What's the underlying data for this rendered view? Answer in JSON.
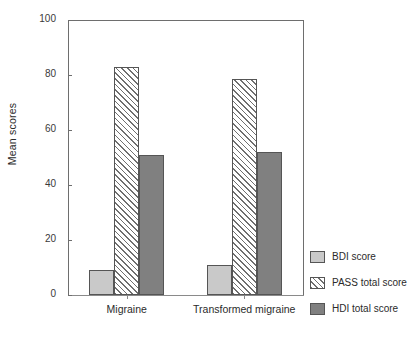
{
  "chart_data": {
    "type": "bar",
    "title": "",
    "subtitle": "",
    "xlabel": "",
    "ylabel": "Mean scores",
    "categories": [
      "Migraine",
      "Transformed migraine"
    ],
    "series": [
      {
        "name": "BDI score",
        "values": [
          9,
          11
        ],
        "style": "solid-light-gray",
        "color": "#c9c9c9"
      },
      {
        "name": "PASS  total score",
        "values": [
          83,
          78.5
        ],
        "style": "diagonal-hatch",
        "color": "#ffffff"
      },
      {
        "name": "HDI total score",
        "values": [
          51,
          52
        ],
        "style": "solid-dark-gray",
        "color": "#808080"
      }
    ],
    "ylim": [
      0,
      100
    ],
    "yticks": [
      0,
      20,
      40,
      60,
      80,
      100
    ],
    "ytick_labels": [
      "0",
      "20",
      "40",
      "60",
      "80",
      "100"
    ],
    "grid": false,
    "legend_position": "right",
    "frame": "box"
  }
}
